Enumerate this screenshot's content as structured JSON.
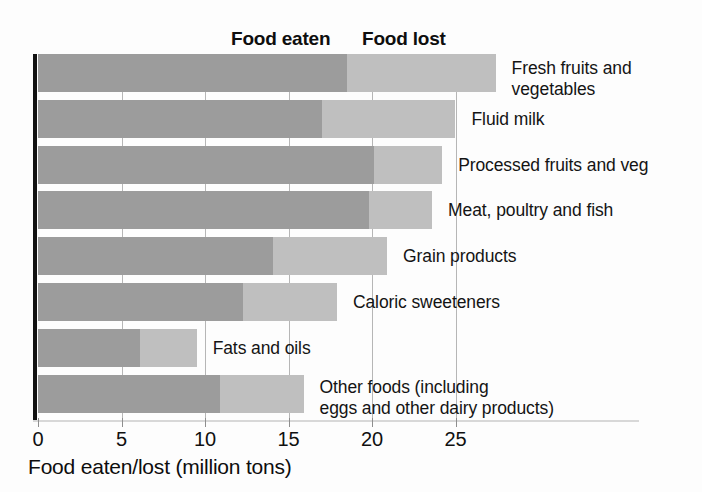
{
  "chart_data": {
    "type": "bar",
    "orientation": "horizontal",
    "stacked": true,
    "title": "",
    "xlabel": "Food eaten/lost (million tons)",
    "ylabel": "",
    "xlim": [
      0,
      28
    ],
    "xticks": [
      0,
      5,
      10,
      15,
      20,
      25
    ],
    "xtick_labels": [
      "0",
      "5",
      "10",
      "15",
      "20",
      "25"
    ],
    "grid": "vertical",
    "legend_position": "top",
    "series": [
      {
        "name": "Food eaten",
        "color": "#9c9c9c",
        "values": [
          18.5,
          17.0,
          20.1,
          19.8,
          14.1,
          12.3,
          6.1,
          10.9
        ]
      },
      {
        "name": "Food lost",
        "color": "#bfbfbf",
        "values": [
          8.9,
          8.0,
          4.1,
          3.8,
          6.8,
          5.6,
          3.4,
          5.0
        ]
      }
    ],
    "categories": [
      "Fresh fruits and\nvegetables",
      "Fluid milk",
      "Processed fruits and veg",
      "Meat, poultry and fish",
      "Grain products",
      "Caloric sweeteners",
      "Fats and oils",
      "Other foods (including\neggs and other dairy products)"
    ],
    "totals": [
      27.4,
      25.0,
      24.2,
      23.6,
      20.9,
      17.9,
      9.5,
      15.9
    ]
  },
  "legend": {
    "eaten_label": "Food eaten",
    "lost_label": "Food lost"
  },
  "axis": {
    "x_title": "Food eaten/lost (million tons)"
  },
  "colors": {
    "eaten": "#9c9c9c",
    "lost": "#bfbfbf",
    "axis": "#121212",
    "grid": "#b6b6b6",
    "background": "#fdfdfd",
    "text": "#111111"
  }
}
